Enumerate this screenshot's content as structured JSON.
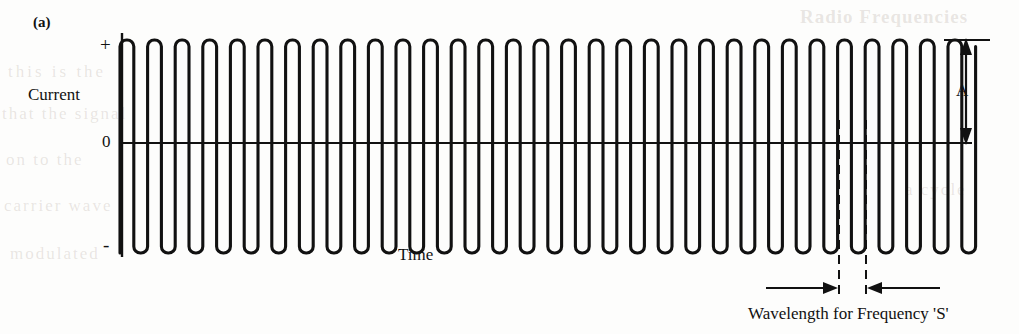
{
  "figure": {
    "panel_label": "(a)",
    "axis": {
      "y_positive": "+",
      "y_zero": "0",
      "y_negative": "-",
      "y_title": "Current",
      "x_title": "Time"
    },
    "annotations": {
      "amplitude_label": "A",
      "wavelength_caption": "Wavelength for Frequency 'S'"
    },
    "background_bleed": {
      "line1": "Radio Frequencies",
      "line2": "this is the",
      "line3": "that the signal",
      "line4": "on to the",
      "line5": "carrier wave",
      "line6": "modulated",
      "line7": "a cycle"
    },
    "colors": {
      "ink": "#111111",
      "paper": "#fdfdfc",
      "bleed": "rgba(150,132,120,0.20)"
    }
  },
  "chart_data": {
    "type": "line",
    "title": "",
    "subtitle": "",
    "xlabel": "Time",
    "ylabel": "Current",
    "grid": false,
    "legend": null,
    "waveform": "square-rounded alternating current",
    "xlim": [
      120,
      972
    ],
    "ylim": [
      -1,
      1
    ],
    "y_tick_labels": [
      "+",
      "0",
      "-"
    ],
    "y_tick_values": [
      1,
      0,
      -1
    ],
    "x_tick_labels": [],
    "cycles": 31,
    "period_px": 27.6,
    "amplitude_units": 1,
    "baseline_y_px": 143,
    "peak_y_px": 40,
    "trough_y_px": 253,
    "annotations": [
      {
        "name": "amplitude-marker",
        "label": "A",
        "type": "double-arrow-vertical",
        "x_px": 966,
        "y_from_px": 40,
        "y_to_px": 143,
        "meaning": "peak amplitude measured from zero to positive peak"
      },
      {
        "name": "wavelength-marker",
        "label": "Wavelength for Frequency 'S'",
        "type": "inward-arrows-horizontal",
        "x_from_px": 839,
        "x_to_px": 866,
        "y_px": 288,
        "meaning": "one full wavelength of the signal frequency S"
      }
    ]
  }
}
